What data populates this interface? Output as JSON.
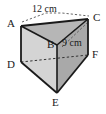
{
  "figure": {
    "kind": "triangular-prism-diagram",
    "background_color": "#ffffff",
    "stroke_color": "#1a1a1a",
    "hidden_edge_style": "dashed",
    "vertices": [
      {
        "id": "A",
        "label": "A",
        "x": 21,
        "y": 26,
        "position": "top-back-left",
        "hidden": false
      },
      {
        "id": "B",
        "label": "B",
        "x": 57,
        "y": 45,
        "position": "top-front",
        "hidden": false
      },
      {
        "id": "C",
        "label": "C",
        "x": 88,
        "y": 19,
        "position": "top-back-right",
        "hidden": false
      },
      {
        "id": "D",
        "label": "D",
        "x": 21,
        "y": 62,
        "position": "bottom-back-left",
        "hidden": true
      },
      {
        "id": "E",
        "label": "E",
        "x": 57,
        "y": 93,
        "position": "bottom-front",
        "hidden": false
      },
      {
        "id": "F",
        "label": "F",
        "x": 88,
        "y": 55,
        "position": "bottom-back-right",
        "hidden": false
      }
    ],
    "faces": [
      {
        "name": "top-triangle",
        "vertices": "A,B,C",
        "fill": "#b4b4b4"
      },
      {
        "name": "left-face",
        "vertices": "A,B,E,D",
        "fill": "#d2d2d2"
      },
      {
        "name": "right-face",
        "vertices": "B,C,F,E",
        "fill": "#a8a8a8"
      }
    ],
    "edges": [
      {
        "name": "edge-AC",
        "from": "A",
        "to": "C",
        "hidden": false
      },
      {
        "name": "edge-AB",
        "from": "A",
        "to": "B",
        "hidden": false
      },
      {
        "name": "edge-BC",
        "from": "B",
        "to": "C",
        "hidden": false
      },
      {
        "name": "edge-AD",
        "from": "A",
        "to": "D",
        "hidden": false
      },
      {
        "name": "edge-BE",
        "from": "B",
        "to": "E",
        "hidden": false
      },
      {
        "name": "edge-CF",
        "from": "C",
        "to": "F",
        "hidden": false
      },
      {
        "name": "edge-DE",
        "from": "D",
        "to": "E",
        "hidden": false
      },
      {
        "name": "edge-EF",
        "from": "E",
        "to": "F",
        "hidden": false
      },
      {
        "name": "edge-DF",
        "from": "D",
        "to": "F",
        "hidden": true
      }
    ],
    "dimensions": [
      {
        "name": "length-AC",
        "text": "12 cm",
        "measures_edge": "A to C",
        "label_x": 32,
        "label_y": 4
      },
      {
        "name": "length-BC",
        "text": "9 cm",
        "measures_edge": "B to C",
        "label_x": 62,
        "label_y": 38
      }
    ]
  }
}
